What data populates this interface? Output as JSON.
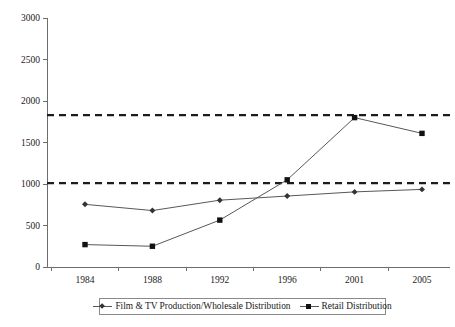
{
  "chart_data": {
    "type": "line",
    "title": "",
    "xlabel": "",
    "ylabel": "",
    "categories": [
      "1984",
      "1988",
      "1992",
      "1996",
      "2001",
      "2005"
    ],
    "ylim": [
      0,
      3000
    ],
    "yticks": [
      0,
      500,
      1000,
      1500,
      2000,
      2500,
      3000
    ],
    "ytick_labels": [
      "0",
      "500",
      "1000",
      "1500",
      "2000",
      "2500",
      "3000"
    ],
    "grid": false,
    "legend_position": "bottom",
    "series": [
      {
        "name": "Film & TV Production/Wholesale Distribution",
        "marker": "diamond",
        "color": "#58585a",
        "values": [
          755,
          680,
          805,
          855,
          905,
          935
        ]
      },
      {
        "name": "Retail Distribution",
        "marker": "square",
        "color": "#58585a",
        "values": [
          270,
          250,
          565,
          1050,
          1800,
          1610
        ]
      }
    ],
    "reference_lines": [
      {
        "name": "upper-threshold",
        "value": 1830,
        "style": "dashed"
      },
      {
        "name": "lower-threshold",
        "value": 1010,
        "style": "dashed"
      }
    ]
  },
  "legend": {
    "entries": [
      {
        "label": "Film & TV Production/Wholesale Distribution",
        "marker": "diamond"
      },
      {
        "label": "Retail Distribution",
        "marker": "square"
      }
    ]
  },
  "colors": {
    "axis": "#6d6d6d",
    "series": "#58585a",
    "reference": "#1c1c1c",
    "text": "#1a1a1a",
    "background": "#ffffff"
  }
}
